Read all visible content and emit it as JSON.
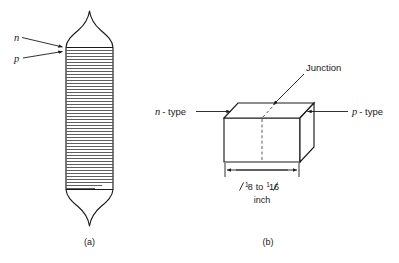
{
  "figure": {
    "title_caption_a": "(a)",
    "title_caption_b": "(b)",
    "colors": {
      "background": "#ffffff",
      "ink": "#1a1a1a",
      "hatch": "#2a2a2a",
      "dashed": "#4a4a4a"
    }
  },
  "figure_a": {
    "caption": "(a)",
    "label_n": "n",
    "label_p": "p",
    "description": "grown-junction crystal ingot with horizontal hatching"
  },
  "figure_b": {
    "caption": "(b)",
    "label_junction": "Junction",
    "label_n_type": "n",
    "label_n_type_suffix": "- type",
    "label_p_type": "p",
    "label_p_type_suffix": "- type",
    "dimension": {
      "frac1_num": "1",
      "frac1_den": "8",
      "connector": "to",
      "frac2_num": "1",
      "frac2_den": "16",
      "unit": "inch",
      "full_text": "1/8 to 1/16 inch"
    }
  }
}
